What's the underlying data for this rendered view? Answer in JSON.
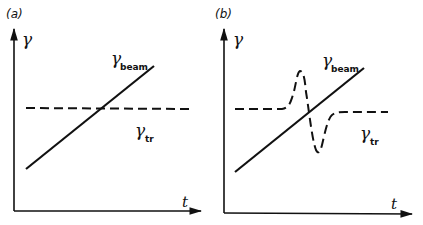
{
  "panels": [
    {
      "id": "a",
      "label": "(a)",
      "y_axis_label": "γ",
      "x_axis_label": "t",
      "curves": {
        "beam": {
          "symbol": "γ",
          "subscript": "beam",
          "style": "solid"
        },
        "transition": {
          "symbol": "γ",
          "subscript": "tr",
          "style": "dashed",
          "shape": "constant"
        }
      }
    },
    {
      "id": "b",
      "label": "(b)",
      "y_axis_label": "γ",
      "x_axis_label": "t",
      "curves": {
        "beam": {
          "symbol": "γ",
          "subscript": "beam",
          "style": "solid"
        },
        "transition": {
          "symbol": "γ",
          "subscript": "tr",
          "style": "dashed",
          "shape": "constant with positive spike then negative dip at crossing (gamma-t jump)"
        }
      }
    }
  ],
  "colors": {
    "line": "#111111",
    "background": "#ffffff"
  }
}
